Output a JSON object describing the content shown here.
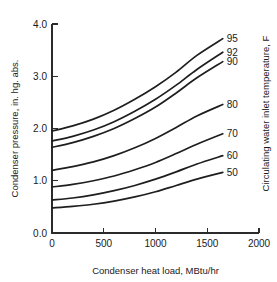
{
  "chart_data": {
    "type": "line",
    "title": "",
    "xlabel": "Condenser heat load, MBtu/hr",
    "ylabel": "Condenser pressure, in. hg. abs.",
    "y2label": "Circulating water inlet temperature, F",
    "xlim": [
      0,
      2000
    ],
    "ylim": [
      0.0,
      4.0
    ],
    "xticks": [
      0,
      500,
      1000,
      1500,
      2000
    ],
    "xtick_labels": [
      "0",
      "500",
      "1000",
      "1500",
      "2000"
    ],
    "yticks": [
      0.0,
      1.0,
      2.0,
      3.0,
      4.0
    ],
    "ytick_labels": [
      "0.0",
      "1.0",
      "2.0",
      "3.0",
      "4.0"
    ],
    "grid": false,
    "legend_position": "right-of-curve-ends",
    "x": [
      0,
      200,
      400,
      600,
      800,
      1000,
      1200,
      1400,
      1650
    ],
    "series": [
      {
        "name": "95",
        "label": "95",
        "values": [
          1.95,
          2.05,
          2.18,
          2.35,
          2.56,
          2.8,
          3.08,
          3.4,
          3.72
        ]
      },
      {
        "name": "92",
        "label": "92",
        "values": [
          1.76,
          1.85,
          1.97,
          2.13,
          2.33,
          2.56,
          2.83,
          3.13,
          3.46
        ]
      },
      {
        "name": "90",
        "label": "90",
        "values": [
          1.64,
          1.73,
          1.85,
          2.0,
          2.19,
          2.41,
          2.68,
          2.97,
          3.28
        ]
      },
      {
        "name": "80",
        "label": "80",
        "values": [
          1.2,
          1.27,
          1.36,
          1.48,
          1.63,
          1.81,
          2.02,
          2.24,
          2.46
        ]
      },
      {
        "name": "70",
        "label": "70",
        "values": [
          0.88,
          0.93,
          1.0,
          1.09,
          1.21,
          1.35,
          1.52,
          1.7,
          1.9
        ]
      },
      {
        "name": "60",
        "label": "60",
        "values": [
          0.63,
          0.67,
          0.73,
          0.81,
          0.91,
          1.03,
          1.17,
          1.32,
          1.48
        ]
      },
      {
        "name": "50",
        "label": "50",
        "values": [
          0.48,
          0.51,
          0.55,
          0.61,
          0.69,
          0.79,
          0.91,
          1.03,
          1.16
        ]
      }
    ]
  }
}
